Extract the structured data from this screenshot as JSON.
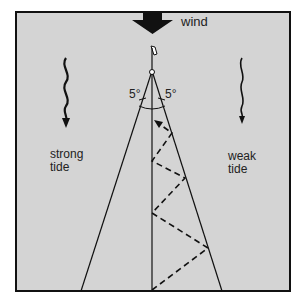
{
  "labels": {
    "wind": "wind",
    "left_tide": [
      "strong",
      "tide"
    ],
    "right_tide": [
      "weak",
      "tide"
    ],
    "angle_left": "5°",
    "angle_right": "5°"
  },
  "colors": {
    "background": "#d4d4d4",
    "ink": "#111111",
    "frame": "#111111"
  },
  "geometry": {
    "frame": {
      "x": 16,
      "y": 12,
      "w": 274,
      "h": 279
    },
    "mark": {
      "x": 152,
      "y": 66
    },
    "centre_line": {
      "x": 152,
      "y1": 66,
      "y2": 291
    },
    "layline_left": {
      "x1": 152,
      "y1": 72,
      "x2": 81,
      "y2": 291
    },
    "layline_right": {
      "x1": 152,
      "y1": 72,
      "x2": 222,
      "y2": 291
    },
    "zigzag": [
      [
        152,
        290
      ],
      [
        208,
        248
      ],
      [
        152,
        213
      ],
      [
        185,
        178
      ],
      [
        152,
        161
      ],
      [
        172,
        133
      ],
      [
        156,
        122
      ]
    ]
  }
}
